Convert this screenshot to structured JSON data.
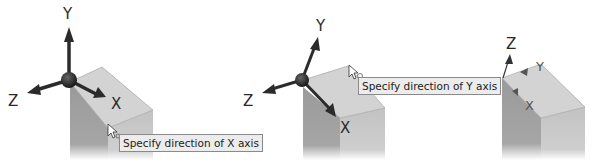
{
  "panels": [
    {
      "id": "panel-1",
      "axes": {
        "y": "Y",
        "z": "Z",
        "x": "X"
      },
      "tooltip": "Specify direction of X axis"
    },
    {
      "id": "panel-2",
      "axes": {
        "y": "Y",
        "z": "Z",
        "x": "X"
      },
      "tooltip": "Specify direction of Y axis"
    },
    {
      "id": "panel-3",
      "axes": {
        "z": "Z",
        "y": "Y",
        "x": "X"
      }
    }
  ],
  "colors": {
    "block_top": "#d2d2d2",
    "block_left": "#9e9e9e",
    "block_right": "#c4c4c4",
    "triad": "#2b2b2b",
    "tooltip_bg": "#ececec",
    "tooltip_border": "#8a8a8a"
  }
}
